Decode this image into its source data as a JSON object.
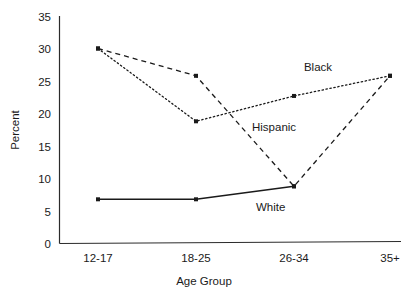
{
  "chart_data": {
    "type": "line",
    "title": "",
    "subtitle": "",
    "xlabel": "Age Group",
    "ylabel": "Percent",
    "categories": [
      "12-17",
      "18-25",
      "26-34",
      "35+"
    ],
    "ylim": [
      0,
      35
    ],
    "yticks": [
      0,
      5,
      10,
      15,
      20,
      25,
      30,
      35
    ],
    "ytick_labels": [
      "0",
      "5",
      "10",
      "15",
      "20",
      "25",
      "30",
      "35"
    ],
    "xtick_labels": [
      "12-17",
      "18-25",
      "26-34",
      "35+"
    ],
    "grid": false,
    "legend": "inline-annotations",
    "series": [
      {
        "name": "Black",
        "style": "dashed",
        "marker": "square",
        "values": [
          30.0,
          25.8,
          8.8,
          25.8
        ]
      },
      {
        "name": "Hispanic",
        "style": "dotted",
        "marker": "square",
        "values": [
          30.0,
          18.8,
          22.7,
          25.8
        ]
      },
      {
        "name": "White",
        "style": "solid",
        "marker": "square",
        "values": [
          6.8,
          6.8,
          8.8,
          null
        ]
      }
    ],
    "annotations": [
      {
        "text": "Black",
        "x_px": 318,
        "y_px": 71
      },
      {
        "text": "Hispanic",
        "x_px": 252,
        "y_px": 131
      },
      {
        "text": "White",
        "x_px": 256,
        "y_px": 211
      }
    ]
  },
  "axis": {
    "y_label": "Percent",
    "x_label": "Age Group"
  },
  "colors": {
    "ink": "#1a1a1a",
    "axis": "#2b2b2b",
    "background": "#ffffff"
  }
}
